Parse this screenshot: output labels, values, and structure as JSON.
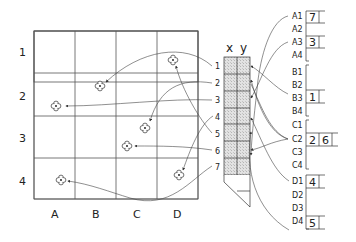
{
  "diagram": {
    "grid": {
      "row_labels": [
        "1",
        "2",
        "3",
        "4"
      ],
      "col_labels": [
        "A",
        "B",
        "C",
        "D"
      ]
    },
    "tape": {
      "header_x": "x",
      "header_y": "y",
      "entries": [
        "1",
        "2",
        "3",
        "4",
        "5",
        "6",
        "7"
      ]
    },
    "table": {
      "keys": [
        "A1",
        "A2",
        "A3",
        "A4",
        "B1",
        "B2",
        "B3",
        "B4",
        "C1",
        "C2",
        "C3",
        "C4",
        "D1",
        "D2",
        "D3",
        "D4"
      ],
      "values": {
        "A1": [
          "7"
        ],
        "A3": [
          "3"
        ],
        "B3": [
          "1"
        ],
        "C2": [
          "2",
          "6"
        ],
        "D1": [
          "4"
        ],
        "D4": [
          "5"
        ]
      },
      "v_A1": "7",
      "v_A3": "3",
      "v_B3": "1",
      "v_C2a": "2",
      "v_C2b": "6",
      "v_D1": "4",
      "v_D4": "5"
    },
    "markers": [
      {
        "id": "1",
        "cell": "B2"
      },
      {
        "id": "2",
        "cell": "C3"
      },
      {
        "id": "3",
        "cell": "A2"
      },
      {
        "id": "4",
        "cell": "D4"
      },
      {
        "id": "5",
        "cell": "D1"
      },
      {
        "id": "6",
        "cell": "C3"
      },
      {
        "id": "7",
        "cell": "A4"
      }
    ],
    "colors": {
      "line": "#333333",
      "tape_fill": "#d8d8d8"
    }
  }
}
